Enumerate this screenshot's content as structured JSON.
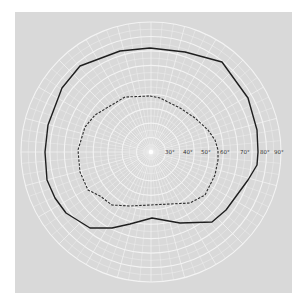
{
  "chart_data": {
    "type": "polar",
    "title": "",
    "subtitle": "",
    "center": [
      151,
      152
    ],
    "degrees_per_ring": 10,
    "max_degrees": 90,
    "radial_tick_labels": [
      "30°",
      "40°",
      "50°",
      "60°",
      "70°",
      "80°",
      "90°"
    ],
    "radial_tick_values": [
      30,
      40,
      50,
      60,
      70,
      80,
      90
    ],
    "grid": true,
    "colors": {
      "page_background": "#ffffff",
      "plot_background": "#d9d9d9",
      "grid": "#f4f4f4",
      "outer_isopter": "#1e1e1e",
      "inner_isopter": "#2a2a2a"
    },
    "series": [
      {
        "name": "outer-isopter",
        "style": "solid",
        "approx_extent_degrees": {
          "superior": 58,
          "inferior": 37,
          "nasal": 59,
          "temporal": 62
        },
        "points_px": [
          [
            150,
            48
          ],
          [
            185,
            52
          ],
          [
            222,
            62
          ],
          [
            248,
            98
          ],
          [
            257,
            130
          ],
          [
            258,
            152
          ],
          [
            257,
            165
          ],
          [
            248,
            180
          ],
          [
            226,
            210
          ],
          [
            212,
            222
          ],
          [
            180,
            223
          ],
          [
            152,
            218
          ],
          [
            130,
            224
          ],
          [
            112,
            228
          ],
          [
            90,
            228
          ],
          [
            66,
            213
          ],
          [
            55,
            198
          ],
          [
            47,
            180
          ],
          [
            45,
            152
          ],
          [
            48,
            125
          ],
          [
            62,
            88
          ],
          [
            80,
            66
          ],
          [
            120,
            51
          ],
          [
            150,
            48
          ]
        ]
      },
      {
        "name": "inner-isopter",
        "style": "dashed",
        "approx_extent_degrees": {
          "superior": 31,
          "inferior": 30,
          "nasal": 41,
          "temporal": 38
        },
        "points_px": [
          [
            150,
            96
          ],
          [
            160,
            98
          ],
          [
            180,
            108
          ],
          [
            195,
            118
          ],
          [
            208,
            130
          ],
          [
            215,
            140
          ],
          [
            218,
            150
          ],
          [
            218,
            160
          ],
          [
            215,
            175
          ],
          [
            205,
            195
          ],
          [
            190,
            203
          ],
          [
            150,
            205
          ],
          [
            130,
            206
          ],
          [
            112,
            205
          ],
          [
            100,
            196
          ],
          [
            88,
            190
          ],
          [
            80,
            172
          ],
          [
            78,
            150
          ],
          [
            85,
            127
          ],
          [
            95,
            115
          ],
          [
            125,
            97
          ],
          [
            150,
            96
          ]
        ]
      }
    ]
  },
  "labels": {
    "t30": "30°",
    "t40": "40°",
    "t50": "50°",
    "t60": "60°",
    "t70": "70°",
    "t80": "80°",
    "t90": "90°"
  }
}
